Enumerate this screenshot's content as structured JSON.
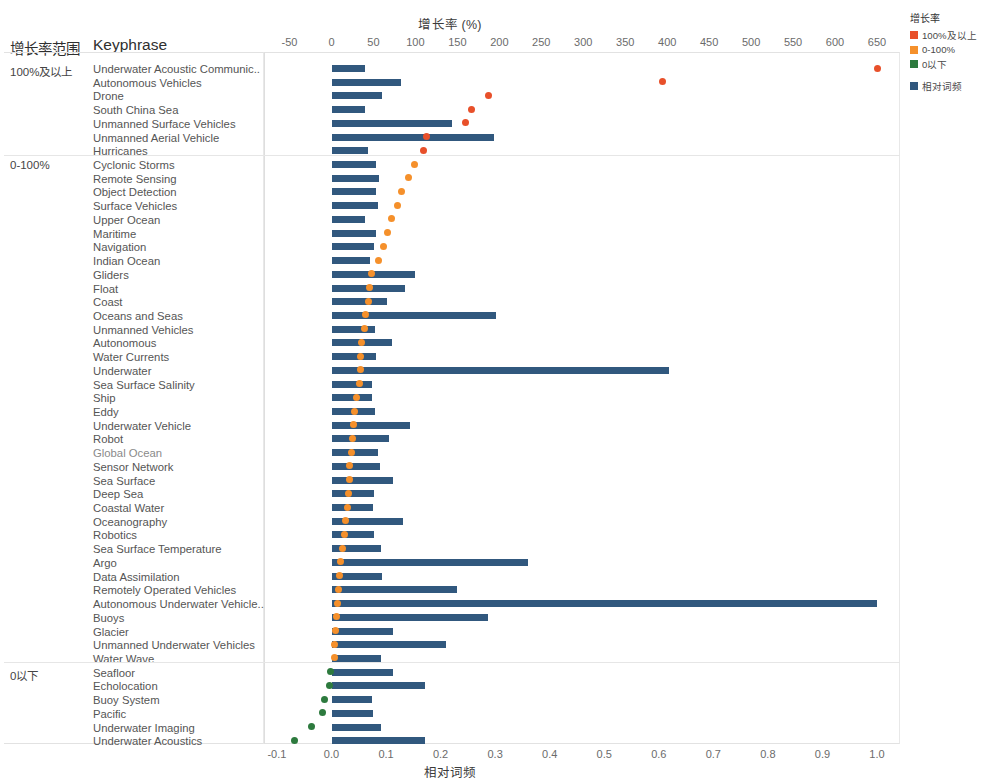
{
  "chart_data": {
    "type": "bar",
    "title": "增长率 (%)",
    "subtitle": "",
    "xlabel": "增长率 (%)",
    "ylabel": "Keyphrase",
    "secondary_xlabel": "相对词频",
    "grid": false,
    "legend_position": "top-right",
    "top_axis": {
      "label": "增长率 (%)",
      "ticks": [
        "-50",
        "0",
        "50",
        "100",
        "150",
        "200",
        "250",
        "300",
        "350",
        "400",
        "450",
        "500",
        "550",
        "600",
        "650"
      ],
      "min": -50,
      "max": 650
    },
    "bottom_axis": {
      "label": "相对词频",
      "ticks": [
        "-0.1",
        "0.0",
        "0.1",
        "0.2",
        "0.3",
        "0.4",
        "0.5",
        "0.6",
        "0.7",
        "0.8",
        "0.9",
        "1.0"
      ],
      "min": -0.1,
      "max": 1.0
    },
    "series": [
      {
        "name": "相对词频",
        "type": "bar",
        "color": "#31587e",
        "axis": "bottom"
      },
      {
        "name": "100%及以上",
        "type": "scatter",
        "color": "#e8502a",
        "axis": "top"
      },
      {
        "name": "0-100%",
        "type": "scatter",
        "color": "#f5902b",
        "axis": "top"
      },
      {
        "name": "0以下",
        "type": "scatter",
        "color": "#2d7a3e",
        "axis": "top"
      }
    ],
    "groups": [
      {
        "label": "100%及以上",
        "color": "#e8502a",
        "rows": [
          {
            "keyphrase": "Underwater Acoustic Communic..",
            "freq": 0.062,
            "growth": 650
          },
          {
            "keyphrase": "Autonomous Vehicles",
            "freq": 0.127,
            "growth": 395
          },
          {
            "keyphrase": "Drone",
            "freq": 0.093,
            "growth": 187
          },
          {
            "keyphrase": "South China Sea",
            "freq": 0.062,
            "growth": 167
          },
          {
            "keyphrase": "Unmanned Surface Vehicles",
            "freq": 0.221,
            "growth": 160
          },
          {
            "keyphrase": "Unmanned Aerial Vehicle",
            "freq": 0.298,
            "growth": 113
          },
          {
            "keyphrase": "Hurricanes",
            "freq": 0.067,
            "growth": 110
          }
        ]
      },
      {
        "label": "0-100%",
        "color": "#f5902b",
        "rows": [
          {
            "keyphrase": "Cyclonic Storms",
            "freq": 0.082,
            "growth": 99
          },
          {
            "keyphrase": "Remote Sensing",
            "freq": 0.087,
            "growth": 92
          },
          {
            "keyphrase": "Object Detection",
            "freq": 0.082,
            "growth": 83
          },
          {
            "keyphrase": "Surface Vehicles",
            "freq": 0.086,
            "growth": 79
          },
          {
            "keyphrase": "Upper Ocean",
            "freq": 0.062,
            "growth": 71
          },
          {
            "keyphrase": "Maritime",
            "freq": 0.082,
            "growth": 67
          },
          {
            "keyphrase": "Navigation",
            "freq": 0.077,
            "growth": 62
          },
          {
            "keyphrase": "Indian Ocean",
            "freq": 0.07,
            "growth": 56
          },
          {
            "keyphrase": "Gliders",
            "freq": 0.153,
            "growth": 48
          },
          {
            "keyphrase": "Float",
            "freq": 0.135,
            "growth": 45
          },
          {
            "keyphrase": "Coast",
            "freq": 0.101,
            "growth": 44
          },
          {
            "keyphrase": "Oceans and Seas",
            "freq": 0.301,
            "growth": 41
          },
          {
            "keyphrase": "Unmanned Vehicles",
            "freq": 0.079,
            "growth": 39
          },
          {
            "keyphrase": "Autonomous",
            "freq": 0.11,
            "growth": 36
          },
          {
            "keyphrase": "Water Currents",
            "freq": 0.082,
            "growth": 35
          },
          {
            "keyphrase": "Underwater",
            "freq": 0.618,
            "growth": 34
          },
          {
            "keyphrase": "Sea Surface Salinity",
            "freq": 0.075,
            "growth": 33
          },
          {
            "keyphrase": "Ship",
            "freq": 0.074,
            "growth": 30
          },
          {
            "keyphrase": "Eddy",
            "freq": 0.079,
            "growth": 28
          },
          {
            "keyphrase": "Underwater Vehicle",
            "freq": 0.143,
            "growth": 26
          },
          {
            "keyphrase": "Robot",
            "freq": 0.106,
            "growth": 25
          },
          {
            "keyphrase": "Global Ocean",
            "freq": 0.086,
            "growth": 24
          },
          {
            "keyphrase": "Sensor Network",
            "freq": 0.088,
            "growth": 22
          },
          {
            "keyphrase": "Sea Surface",
            "freq": 0.113,
            "growth": 21
          },
          {
            "keyphrase": "Deep Sea",
            "freq": 0.078,
            "growth": 20
          },
          {
            "keyphrase": "Coastal Water",
            "freq": 0.076,
            "growth": 19
          },
          {
            "keyphrase": "Oceanography",
            "freq": 0.131,
            "growth": 17
          },
          {
            "keyphrase": "Robotics",
            "freq": 0.078,
            "growth": 15
          },
          {
            "keyphrase": "Sea Surface Temperature",
            "freq": 0.091,
            "growth": 13
          },
          {
            "keyphrase": "Argo",
            "freq": 0.36,
            "growth": 11
          },
          {
            "keyphrase": "Data Assimilation",
            "freq": 0.092,
            "growth": 9
          },
          {
            "keyphrase": "Remotely Operated Vehicles",
            "freq": 0.23,
            "growth": 8
          },
          {
            "keyphrase": "Autonomous Underwater Vehicle..",
            "freq": 1.0,
            "growth": 7
          },
          {
            "keyphrase": "Buoys",
            "freq": 0.286,
            "growth": 6
          },
          {
            "keyphrase": "Glacier",
            "freq": 0.113,
            "growth": 5
          },
          {
            "keyphrase": "Unmanned Underwater Vehicles",
            "freq": 0.209,
            "growth": 4
          },
          {
            "keyphrase": "Water Wave",
            "freq": 0.091,
            "growth": 3
          }
        ]
      },
      {
        "label": "0以下",
        "color": "#2d7a3e",
        "rows": [
          {
            "keyphrase": "Seafloor",
            "freq": 0.112,
            "growth": -1
          },
          {
            "keyphrase": "Echolocation",
            "freq": 0.172,
            "growth": -2
          },
          {
            "keyphrase": "Buoy System",
            "freq": 0.074,
            "growth": -8
          },
          {
            "keyphrase": "Pacific",
            "freq": 0.076,
            "growth": -11
          },
          {
            "keyphrase": "Underwater Imaging",
            "freq": 0.09,
            "growth": -24
          },
          {
            "keyphrase": "Underwater Acoustics",
            "freq": 0.171,
            "growth": -44
          }
        ]
      }
    ]
  },
  "headers": {
    "range": "增长率范围",
    "keyphrase": "Keyphrase"
  },
  "legend": {
    "title": "增长率",
    "items": [
      {
        "label": "100%及以上",
        "color": "#e8502a"
      },
      {
        "label": "0-100%",
        "color": "#f5902b"
      },
      {
        "label": "0以下",
        "color": "#2d7a3e"
      }
    ],
    "bar_item": {
      "label": "相对词频",
      "color": "#31587e"
    }
  }
}
